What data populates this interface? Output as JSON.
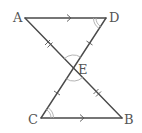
{
  "diagram": {
    "type": "geometry",
    "points": {
      "A": {
        "label": "A",
        "x": 25,
        "y": 18
      },
      "D": {
        "label": "D",
        "x": 106,
        "y": 18
      },
      "C": {
        "label": "C",
        "x": 41,
        "y": 118
      },
      "B": {
        "label": "B",
        "x": 122,
        "y": 118
      },
      "E": {
        "label": "E",
        "x": 73.5,
        "y": 68
      }
    },
    "segments": [
      "AD",
      "CB",
      "AB",
      "DC"
    ],
    "parallel_marks": [
      "AD",
      "CB"
    ],
    "equal_length_single_tick": [
      "DE",
      "EC"
    ],
    "equal_length_double_tick": [
      "AE",
      "EB"
    ],
    "angle_marks": {
      "double_arc": [
        "ADE",
        "ECB"
      ],
      "single_arc": [
        "AED",
        "CEB"
      ]
    },
    "colors": {
      "line": "#4a4a4a",
      "arc": "#aaaaaa",
      "label": "#555555"
    }
  }
}
